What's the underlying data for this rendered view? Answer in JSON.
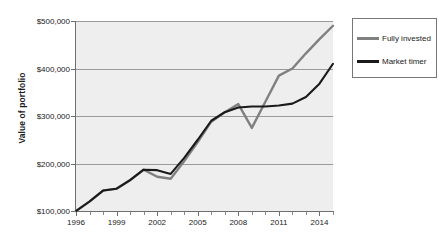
{
  "chart_data": {
    "type": "line",
    "title": "",
    "xlabel": "",
    "ylabel": "Value of portfolio",
    "xlim": [
      1996,
      2015
    ],
    "ylim": [
      100000,
      500000
    ],
    "grid": true,
    "legend_position": "right",
    "x": [
      1996,
      1997,
      1998,
      1999,
      2000,
      2001,
      2002,
      2003,
      2004,
      2005,
      2006,
      2007,
      2008,
      2009,
      2010,
      2011,
      2012,
      2013,
      2014,
      2015
    ],
    "x_tick_labels": [
      "1996",
      "1999",
      "2002",
      "2005",
      "2008",
      "2011",
      "2014"
    ],
    "x_tick_values": [
      1996,
      1999,
      2002,
      2005,
      2008,
      2011,
      2014
    ],
    "y_tick_labels": [
      "$100,000",
      "$200,000",
      "$300,000",
      "$400,000",
      "$500,000"
    ],
    "y_tick_values": [
      100000,
      200000,
      300000,
      400000,
      500000
    ],
    "series": [
      {
        "name": "Fully invested",
        "color": "#808080",
        "values": [
          100000,
          120000,
          143000,
          147000,
          165000,
          187000,
          172000,
          168000,
          205000,
          245000,
          288000,
          308000,
          325000,
          275000,
          330000,
          385000,
          400000,
          432000,
          462000,
          490000
        ]
      },
      {
        "name": "Market timer",
        "color": "#1a1a1a",
        "values": [
          100000,
          120000,
          143000,
          147000,
          165000,
          187000,
          186000,
          178000,
          212000,
          250000,
          290000,
          308000,
          318000,
          320000,
          320000,
          322000,
          326000,
          340000,
          368000,
          410000
        ]
      }
    ]
  },
  "legend": {
    "items": [
      {
        "label": "Fully invested",
        "color": "#808080"
      },
      {
        "label": "Market timer",
        "color": "#1a1a1a"
      }
    ]
  }
}
